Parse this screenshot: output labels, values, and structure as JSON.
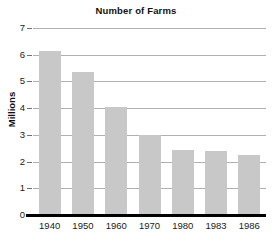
{
  "chart_data": {
    "type": "bar",
    "title": "Number of Farms",
    "xlabel": "",
    "ylabel": "Millions",
    "categories": [
      "1940",
      "1950",
      "1960",
      "1970",
      "1980",
      "1983",
      "1986"
    ],
    "values": [
      6.1,
      5.3,
      4.0,
      2.95,
      2.4,
      2.35,
      2.2
    ],
    "ylim": [
      0,
      7
    ],
    "ytick_labels": [
      "0",
      "1",
      "2",
      "3",
      "4",
      "5",
      "6",
      "7"
    ],
    "ytick_values": [
      0,
      1,
      2,
      3,
      4,
      5,
      6,
      7
    ],
    "grid": true,
    "legend": false,
    "bar_color": "#c8c8c8",
    "gridline_color": "#b0b0b0",
    "axis_color": "#000000",
    "background_color": "#ffffff"
  }
}
